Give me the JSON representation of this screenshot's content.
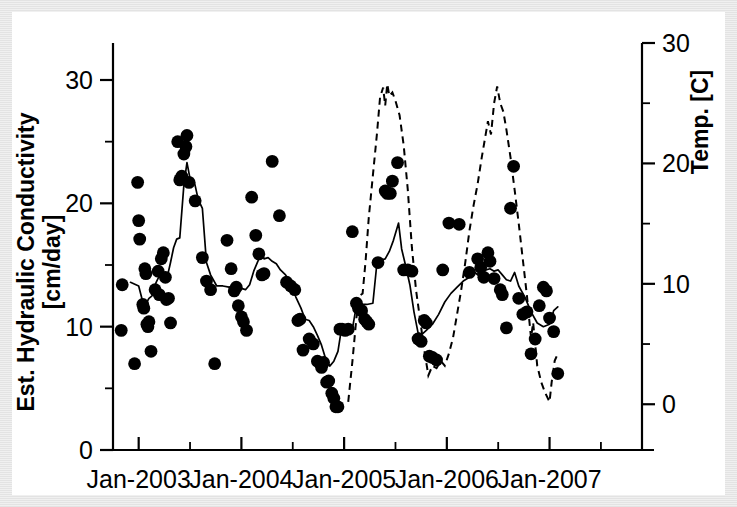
{
  "chart_data": {
    "type": "scatter",
    "title": "",
    "xlabel": "",
    "ylabel": "Est. Hydraulic Conductivity [cm/day]",
    "y2label": "Temp. [C]",
    "xlim": [
      2002.75,
      2007.9
    ],
    "ylim": [
      0,
      33
    ],
    "y2lim": [
      -3.8,
      30
    ],
    "grid": false,
    "legend": "none",
    "x_tick_labels": [
      "Jan-2003",
      "Jan-2004",
      "Jan-2005",
      "Jan-2006",
      "Jan-2007"
    ],
    "x_tick_values": [
      2003,
      2004,
      2005,
      2006,
      2007
    ],
    "x_minor_tick_values": [
      2003.5,
      2004.5,
      2005.5,
      2006.5,
      2007.5
    ],
    "y_tick_labels": [
      "0",
      "10",
      "20",
      "30"
    ],
    "y_tick_values": [
      0,
      10,
      20,
      30
    ],
    "y_minor_tick_values": [
      5,
      15,
      25
    ],
    "y2_tick_labels": [
      "0",
      "10",
      "20",
      "30"
    ],
    "y2_tick_values": [
      0,
      10,
      20,
      30
    ],
    "y2_minor_tick_values": [
      5,
      15,
      25
    ],
    "series": [
      {
        "name": "Est. Hydraulic Conductivity observations",
        "type": "scatter",
        "marker": "filled-circle",
        "color": "#000000",
        "axis": "left",
        "points": [
          [
            2002.83,
            9.7
          ],
          [
            2002.84,
            13.4
          ],
          [
            2002.96,
            7.0
          ],
          [
            2002.99,
            21.7
          ],
          [
            2003.0,
            18.6
          ],
          [
            2003.01,
            17.1
          ],
          [
            2003.04,
            11.8
          ],
          [
            2003.05,
            11.5
          ],
          [
            2003.06,
            14.7
          ],
          [
            2003.07,
            14.3
          ],
          [
            2003.08,
            10.2
          ],
          [
            2003.09,
            10.0
          ],
          [
            2003.1,
            10.4
          ],
          [
            2003.12,
            8.0
          ],
          [
            2003.16,
            13.0
          ],
          [
            2003.19,
            14.5
          ],
          [
            2003.2,
            12.6
          ],
          [
            2003.22,
            15.5
          ],
          [
            2003.24,
            16.0
          ],
          [
            2003.26,
            14.0
          ],
          [
            2003.27,
            12.2
          ],
          [
            2003.29,
            12.3
          ],
          [
            2003.31,
            10.3
          ],
          [
            2003.38,
            25.0
          ],
          [
            2003.4,
            21.9
          ],
          [
            2003.42,
            22.2
          ],
          [
            2003.44,
            24.0
          ],
          [
            2003.46,
            24.6
          ],
          [
            2003.47,
            25.5
          ],
          [
            2003.49,
            21.7
          ],
          [
            2003.55,
            20.2
          ],
          [
            2003.62,
            15.6
          ],
          [
            2003.66,
            13.7
          ],
          [
            2003.7,
            13.0
          ],
          [
            2003.74,
            7.0
          ],
          [
            2003.86,
            17.0
          ],
          [
            2003.9,
            14.7
          ],
          [
            2003.93,
            12.9
          ],
          [
            2003.95,
            13.2
          ],
          [
            2003.97,
            11.7
          ],
          [
            2004.0,
            10.8
          ],
          [
            2004.02,
            10.4
          ],
          [
            2004.05,
            9.7
          ],
          [
            2004.1,
            20.5
          ],
          [
            2004.14,
            17.4
          ],
          [
            2004.17,
            15.9
          ],
          [
            2004.2,
            14.2
          ],
          [
            2004.22,
            14.3
          ],
          [
            2004.3,
            23.4
          ],
          [
            2004.37,
            19.0
          ],
          [
            2004.44,
            13.6
          ],
          [
            2004.48,
            13.3
          ],
          [
            2004.52,
            13.0
          ],
          [
            2004.55,
            10.5
          ],
          [
            2004.57,
            10.6
          ],
          [
            2004.6,
            8.1
          ],
          [
            2004.66,
            9.0
          ],
          [
            2004.7,
            8.6
          ],
          [
            2004.74,
            7.2
          ],
          [
            2004.78,
            6.7
          ],
          [
            2004.8,
            7.1
          ],
          [
            2004.83,
            5.5
          ],
          [
            2004.85,
            5.6
          ],
          [
            2004.88,
            4.6
          ],
          [
            2004.9,
            4.2
          ],
          [
            2004.92,
            3.5
          ],
          [
            2004.94,
            3.5
          ],
          [
            2004.96,
            9.8
          ],
          [
            2004.98,
            9.8
          ],
          [
            2005.01,
            9.7
          ],
          [
            2005.04,
            9.8
          ],
          [
            2005.08,
            17.7
          ],
          [
            2005.12,
            11.9
          ],
          [
            2005.14,
            11.5
          ],
          [
            2005.17,
            11.3
          ],
          [
            2005.2,
            10.6
          ],
          [
            2005.22,
            10.4
          ],
          [
            2005.24,
            10.2
          ],
          [
            2005.33,
            15.2
          ],
          [
            2005.4,
            21.0
          ],
          [
            2005.42,
            20.8
          ],
          [
            2005.45,
            20.8
          ],
          [
            2005.47,
            21.8
          ],
          [
            2005.52,
            23.3
          ],
          [
            2005.58,
            14.6
          ],
          [
            2005.62,
            14.6
          ],
          [
            2005.66,
            14.5
          ],
          [
            2005.72,
            9.0
          ],
          [
            2005.75,
            8.8
          ],
          [
            2005.78,
            10.5
          ],
          [
            2005.8,
            10.3
          ],
          [
            2005.83,
            7.6
          ],
          [
            2005.86,
            7.5
          ],
          [
            2005.9,
            7.3
          ],
          [
            2005.96,
            14.6
          ],
          [
            2006.02,
            18.4
          ],
          [
            2006.12,
            18.3
          ],
          [
            2006.22,
            14.4
          ],
          [
            2006.3,
            15.5
          ],
          [
            2006.33,
            14.8
          ],
          [
            2006.36,
            14.0
          ],
          [
            2006.4,
            16.0
          ],
          [
            2006.42,
            15.3
          ],
          [
            2006.46,
            13.9
          ],
          [
            2006.52,
            13.0
          ],
          [
            2006.54,
            12.6
          ],
          [
            2006.58,
            9.9
          ],
          [
            2006.62,
            19.6
          ],
          [
            2006.65,
            23.0
          ],
          [
            2006.7,
            12.3
          ],
          [
            2006.74,
            11.0
          ],
          [
            2006.78,
            11.2
          ],
          [
            2006.82,
            7.8
          ],
          [
            2006.86,
            9.0
          ],
          [
            2006.9,
            11.7
          ],
          [
            2006.94,
            13.2
          ],
          [
            2006.97,
            12.9
          ],
          [
            2007.0,
            10.7
          ],
          [
            2007.04,
            9.6
          ],
          [
            2007.08,
            6.2
          ]
        ]
      },
      {
        "name": "Est. Hydraulic Conductivity moving average",
        "type": "line",
        "style": "solid",
        "color": "#000000",
        "axis": "left",
        "points": [
          [
            2002.92,
            13.6
          ],
          [
            2003.0,
            13.3
          ],
          [
            2003.04,
            12.0
          ],
          [
            2003.06,
            11.3
          ],
          [
            2003.08,
            12.0
          ],
          [
            2003.1,
            12.3
          ],
          [
            2003.13,
            12.5
          ],
          [
            2003.17,
            13.6
          ],
          [
            2003.2,
            14.1
          ],
          [
            2003.22,
            14.4
          ],
          [
            2003.24,
            13.9
          ],
          [
            2003.26,
            14.2
          ],
          [
            2003.28,
            14.1
          ],
          [
            2003.31,
            15.2
          ],
          [
            2003.34,
            16.4
          ],
          [
            2003.37,
            17.1
          ],
          [
            2003.4,
            17.2
          ],
          [
            2003.44,
            21.5
          ],
          [
            2003.47,
            23.3
          ],
          [
            2003.5,
            22.0
          ],
          [
            2003.54,
            21.8
          ],
          [
            2003.58,
            20.3
          ],
          [
            2003.62,
            19.6
          ],
          [
            2003.66,
            15.2
          ],
          [
            2003.7,
            14.2
          ],
          [
            2003.76,
            13.3
          ],
          [
            2003.82,
            13.3
          ],
          [
            2003.88,
            13.2
          ],
          [
            2003.94,
            13.3
          ],
          [
            2004.0,
            13.1
          ],
          [
            2004.04,
            13.0
          ],
          [
            2004.08,
            13.4
          ],
          [
            2004.12,
            14.5
          ],
          [
            2004.16,
            15.3
          ],
          [
            2004.2,
            16.0
          ],
          [
            2004.22,
            15.5
          ],
          [
            2004.26,
            15.6
          ],
          [
            2004.3,
            15.3
          ],
          [
            2004.34,
            15.1
          ],
          [
            2004.38,
            14.6
          ],
          [
            2004.43,
            14.2
          ],
          [
            2004.48,
            13.5
          ],
          [
            2004.53,
            12.4
          ],
          [
            2004.58,
            11.5
          ],
          [
            2004.62,
            10.6
          ],
          [
            2004.66,
            10.5
          ],
          [
            2004.7,
            10.0
          ],
          [
            2004.74,
            9.3
          ],
          [
            2004.78,
            8.5
          ],
          [
            2004.82,
            7.4
          ],
          [
            2004.86,
            6.8
          ],
          [
            2004.9,
            7.2
          ],
          [
            2004.94,
            8.0
          ],
          [
            2004.97,
            9.6
          ],
          [
            2005.0,
            9.8
          ],
          [
            2005.04,
            9.7
          ],
          [
            2005.08,
            9.8
          ],
          [
            2005.12,
            11.7
          ],
          [
            2005.16,
            11.8
          ],
          [
            2005.22,
            11.8
          ],
          [
            2005.28,
            11.9
          ],
          [
            2005.32,
            15.2
          ],
          [
            2005.36,
            15.4
          ],
          [
            2005.4,
            15.5
          ],
          [
            2005.44,
            16.1
          ],
          [
            2005.48,
            17.0
          ],
          [
            2005.53,
            18.4
          ],
          [
            2005.56,
            16.3
          ],
          [
            2005.6,
            14.9
          ],
          [
            2005.64,
            13.4
          ],
          [
            2005.68,
            11.2
          ],
          [
            2005.72,
            9.5
          ],
          [
            2005.76,
            9.4
          ],
          [
            2005.8,
            9.7
          ],
          [
            2005.86,
            10.2
          ],
          [
            2005.92,
            11.0
          ],
          [
            2005.98,
            12.0
          ],
          [
            2006.04,
            12.7
          ],
          [
            2006.1,
            13.2
          ],
          [
            2006.16,
            13.7
          ],
          [
            2006.22,
            14.0
          ],
          [
            2006.26,
            14.5
          ],
          [
            2006.3,
            14.2
          ],
          [
            2006.34,
            14.8
          ],
          [
            2006.38,
            14.6
          ],
          [
            2006.42,
            14.7
          ],
          [
            2006.46,
            14.5
          ],
          [
            2006.5,
            14.6
          ],
          [
            2006.54,
            14.2
          ],
          [
            2006.58,
            13.8
          ],
          [
            2006.62,
            13.7
          ],
          [
            2006.66,
            14.4
          ],
          [
            2006.7,
            13.3
          ],
          [
            2006.76,
            12.4
          ],
          [
            2006.82,
            11.2
          ],
          [
            2006.88,
            10.3
          ],
          [
            2006.94,
            10.0
          ],
          [
            2007.0,
            10.2
          ],
          [
            2007.04,
            11.3
          ],
          [
            2007.08,
            11.6
          ]
        ]
      },
      {
        "name": "Temperature",
        "type": "line",
        "style": "dashed",
        "color": "#000000",
        "axis": "right",
        "points": [
          [
            2005.04,
            0.2
          ],
          [
            2005.08,
            3.5
          ],
          [
            2005.12,
            7.2
          ],
          [
            2005.15,
            9.0
          ],
          [
            2005.18,
            9.2
          ],
          [
            2005.21,
            12.0
          ],
          [
            2005.24,
            15.5
          ],
          [
            2005.28,
            19.0
          ],
          [
            2005.32,
            22.5
          ],
          [
            2005.35,
            25.5
          ],
          [
            2005.38,
            26.3
          ],
          [
            2005.4,
            24.8
          ],
          [
            2005.42,
            26.6
          ],
          [
            2005.44,
            25.6
          ],
          [
            2005.47,
            25.9
          ],
          [
            2005.5,
            25.2
          ],
          [
            2005.54,
            24.0
          ],
          [
            2005.58,
            21.5
          ],
          [
            2005.62,
            17.8
          ],
          [
            2005.66,
            13.0
          ],
          [
            2005.7,
            9.5
          ],
          [
            2005.74,
            7.0
          ],
          [
            2005.78,
            4.5
          ],
          [
            2005.82,
            2.4
          ],
          [
            2005.86,
            3.2
          ],
          [
            2005.9,
            3.0
          ],
          [
            2005.94,
            3.6
          ],
          [
            2005.98,
            3.2
          ],
          [
            2006.02,
            4.2
          ],
          [
            2006.06,
            5.5
          ],
          [
            2006.1,
            7.5
          ],
          [
            2006.14,
            9.5
          ],
          [
            2006.18,
            11.8
          ],
          [
            2006.22,
            14.4
          ],
          [
            2006.26,
            16.5
          ],
          [
            2006.3,
            18.3
          ],
          [
            2006.34,
            20.5
          ],
          [
            2006.37,
            22.0
          ],
          [
            2006.4,
            23.5
          ],
          [
            2006.43,
            22.4
          ],
          [
            2006.46,
            25.0
          ],
          [
            2006.49,
            26.4
          ],
          [
            2006.52,
            25.0
          ],
          [
            2006.55,
            24.3
          ],
          [
            2006.58,
            22.8
          ],
          [
            2006.62,
            20.5
          ],
          [
            2006.66,
            17.8
          ],
          [
            2006.7,
            15.0
          ],
          [
            2006.74,
            12.0
          ],
          [
            2006.78,
            9.0
          ],
          [
            2006.8,
            7.2
          ],
          [
            2006.82,
            5.5
          ],
          [
            2006.84,
            6.8
          ],
          [
            2006.86,
            5.0
          ],
          [
            2006.88,
            3.2
          ],
          [
            2006.92,
            1.8
          ],
          [
            2006.96,
            0.9
          ],
          [
            2007.0,
            0.2
          ],
          [
            2007.02,
            1.8
          ],
          [
            2007.05,
            3.6
          ],
          [
            2007.07,
            4.0
          ],
          [
            2007.09,
            3.7
          ]
        ]
      }
    ]
  }
}
